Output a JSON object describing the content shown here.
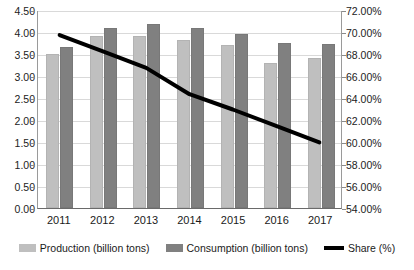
{
  "chart_data": {
    "type": "bar",
    "title": "",
    "subtitle": "",
    "xlabel": "",
    "ylabel": "",
    "categories": [
      "2011",
      "2012",
      "2013",
      "2014",
      "2015",
      "2016",
      "2017"
    ],
    "series": [
      {
        "name": "Production (billion tons)",
        "type": "bar",
        "axis": "left",
        "color": "#bfbfbf",
        "values": [
          3.5,
          3.92,
          3.92,
          3.82,
          3.7,
          3.3,
          3.42
        ]
      },
      {
        "name": "Consumption (billion tons)",
        "type": "bar",
        "axis": "left",
        "color": "#808080",
        "values": [
          3.65,
          4.1,
          4.18,
          4.08,
          3.95,
          3.75,
          3.73
        ]
      },
      {
        "name": "Share (%)",
        "type": "line",
        "axis": "right",
        "color": "#000000",
        "values": [
          69.8,
          68.3,
          66.8,
          64.4,
          63.0,
          61.5,
          60.0
        ]
      }
    ],
    "left_axis": {
      "label": "",
      "ylim": [
        0.0,
        4.5
      ],
      "tick_step": 0.5,
      "ticks": [
        "0.00",
        "0.50",
        "1.00",
        "1.50",
        "2.00",
        "2.50",
        "3.00",
        "3.50",
        "4.00",
        "4.50"
      ],
      "tick_values": [
        0.0,
        0.5,
        1.0,
        1.5,
        2.0,
        2.5,
        3.0,
        3.5,
        4.0,
        4.5
      ]
    },
    "right_axis": {
      "label": "",
      "ylim": [
        54.0,
        72.0
      ],
      "tick_step": 2.0,
      "ticks": [
        "54.00%",
        "56.00%",
        "58.00%",
        "60.00%",
        "62.00%",
        "64.00%",
        "66.00%",
        "68.00%",
        "70.00%",
        "72.00%"
      ],
      "tick_values": [
        54.0,
        56.0,
        58.0,
        60.0,
        62.0,
        64.0,
        66.0,
        68.0,
        70.0,
        72.0
      ]
    },
    "grid": true,
    "legend_position": "bottom",
    "legend": [
      "Production (billion tons)",
      "Consumption (billion tons)",
      "Share (%)"
    ]
  },
  "caption": {
    "text": ""
  }
}
